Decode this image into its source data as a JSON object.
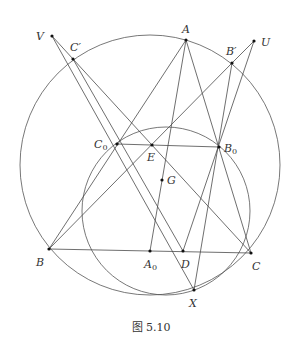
{
  "caption": "图 5.10",
  "colors": {
    "line": "#4a4a4a",
    "point": "#111111",
    "text": "#333333",
    "background": "#ffffff"
  },
  "circles": [
    {
      "name": "circumcircle",
      "cx": 150,
      "cy": 165,
      "r": 130
    },
    {
      "name": "nine-point-circle",
      "cx": 166,
      "cy": 211,
      "r": 84
    }
  ],
  "points": {
    "A": {
      "x": 186,
      "y": 40,
      "label": "A",
      "sub": "",
      "lx": 182,
      "ly": 33
    },
    "B": {
      "x": 49,
      "y": 249,
      "label": "B",
      "sub": "",
      "lx": 36,
      "ly": 266
    },
    "C": {
      "x": 251,
      "y": 253,
      "label": "C",
      "sub": "",
      "lx": 252,
      "ly": 270
    },
    "A0": {
      "x": 150,
      "y": 251,
      "label": "A",
      "sub": "0",
      "lx": 144,
      "ly": 268
    },
    "B0": {
      "x": 219,
      "y": 147,
      "label": "B",
      "sub": "0",
      "lx": 224,
      "ly": 152
    },
    "C0": {
      "x": 117,
      "y": 144,
      "label": "C",
      "sub": "0",
      "lx": 94,
      "ly": 148
    },
    "D": {
      "x": 183,
      "y": 251,
      "label": "D",
      "sub": "",
      "lx": 181,
      "ly": 268
    },
    "E": {
      "x": 152,
      "y": 145,
      "label": "E",
      "sub": "",
      "lx": 147,
      "ly": 161
    },
    "G": {
      "x": 162,
      "y": 180,
      "label": "G",
      "sub": "",
      "lx": 167,
      "ly": 184
    },
    "X": {
      "x": 194,
      "y": 290,
      "label": "X",
      "sub": "",
      "lx": 189,
      "ly": 307
    },
    "U": {
      "x": 254,
      "y": 41,
      "label": "U",
      "sub": "",
      "lx": 261,
      "ly": 46
    },
    "V": {
      "x": 52,
      "y": 36,
      "label": "V",
      "sub": "",
      "lx": 36,
      "ly": 40
    },
    "Bp": {
      "x": 232,
      "y": 63,
      "label": "B′",
      "sub": "",
      "lx": 226,
      "ly": 55
    },
    "Cp": {
      "x": 73,
      "y": 59,
      "label": "C′",
      "sub": "",
      "lx": 70,
      "ly": 51
    }
  },
  "segments": [
    [
      "A",
      "B"
    ],
    [
      "A",
      "C"
    ],
    [
      "B",
      "C"
    ],
    [
      "A",
      "A0"
    ],
    [
      "C0",
      "B0"
    ],
    [
      "B",
      "Bp"
    ],
    [
      "Bp",
      "U"
    ],
    [
      "U",
      "D"
    ],
    [
      "Bp",
      "X"
    ],
    [
      "Cp",
      "C"
    ],
    [
      "V",
      "X"
    ],
    [
      "Cp",
      "D"
    ],
    [
      "V",
      "Cp"
    ]
  ]
}
